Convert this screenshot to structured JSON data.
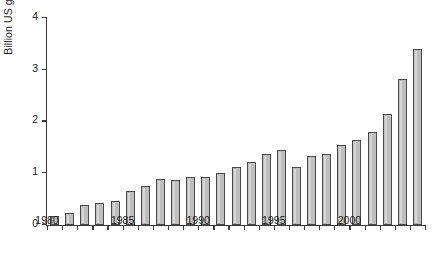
{
  "chart_data": {
    "type": "bar",
    "title": "",
    "subtitle": "",
    "xlabel": "",
    "ylabel": "Billion US gallons",
    "categories": [
      1980,
      1981,
      1982,
      1983,
      1984,
      1985,
      1986,
      1987,
      1988,
      1989,
      1990,
      1991,
      1992,
      1993,
      1994,
      1995,
      1996,
      1997,
      1998,
      1999,
      2000,
      2001,
      2002,
      2003,
      2004
    ],
    "values": [
      0.18,
      0.24,
      0.39,
      0.43,
      0.47,
      0.66,
      0.76,
      0.88,
      0.87,
      0.92,
      0.92,
      1.0,
      1.12,
      1.21,
      1.38,
      1.44,
      1.13,
      1.34,
      1.38,
      1.54,
      1.64,
      1.8,
      2.15,
      2.83,
      3.4
    ],
    "ylim": [
      0,
      4
    ],
    "yticks": [
      0,
      1,
      2,
      3,
      4
    ],
    "ytick_labels": [
      "0",
      "1",
      "2",
      "3",
      "4"
    ],
    "xtick_labels": [
      "1980",
      "1985",
      "1990",
      "1995",
      "2000"
    ],
    "xtick_years": [
      1980,
      1985,
      1990,
      1995,
      2000
    ],
    "xlim": [
      1979.5,
      2004.5
    ],
    "grid": false,
    "legend": false,
    "bar_color": "#bebebe",
    "bar_border_color": "#4a4a4a",
    "axis_color": "#3a3a3a"
  }
}
